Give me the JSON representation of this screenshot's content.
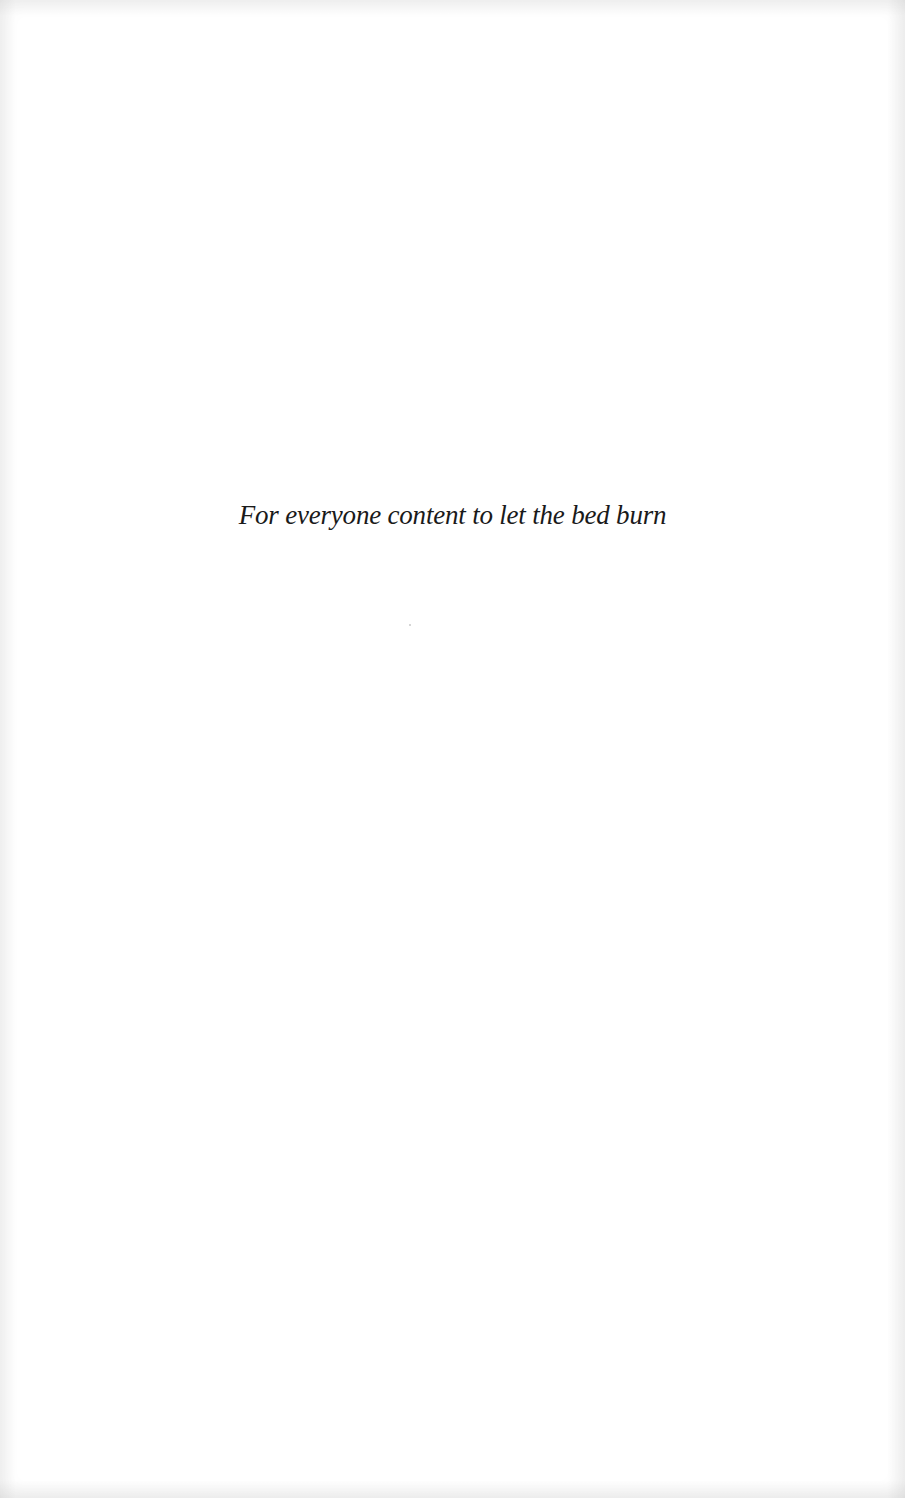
{
  "page": {
    "type": "dedication",
    "dedication_text": "For everyone content to let the bed burn",
    "colors": {
      "background": "#ffffff",
      "text": "#1a1a1a"
    }
  }
}
